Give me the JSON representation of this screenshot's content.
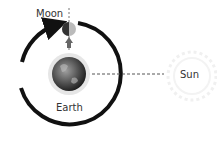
{
  "diagram": {
    "labels": {
      "moon": "Moon",
      "earth": "Earth",
      "sun": "Sun"
    },
    "colors": {
      "orbit": "#111111",
      "earth_dark": "#2a2a2a",
      "earth_light": "#9a9a9a",
      "halo": "#e4e4e4",
      "dashed_line": "#555555",
      "sun_glow": "#f2f2f2"
    }
  }
}
